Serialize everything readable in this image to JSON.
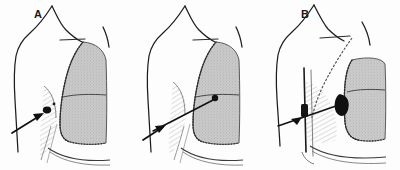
{
  "figure": {
    "background_color": "#fdfdfd",
    "ink_color": "#1a1a1a",
    "lung_fill_color": "#c8c8c8",
    "lesion_color": "#111111",
    "panel_count": 3
  },
  "panels": [
    {
      "id": "a",
      "label": "A",
      "label_x": 34,
      "label_y": 9,
      "caption": "Peripheral pleural-based lesion at chest wall with arrow marker",
      "lung_fill": "#c8c8c8",
      "marker": {
        "type": "arrow",
        "target": "pleural-surface-lesion",
        "direction": "up-right",
        "tail_x": 12,
        "tail_y": 133,
        "tip_x": 44,
        "tip_y": 114
      },
      "lesion": {
        "shape": "small-dark-nodule",
        "cx": 47,
        "cy": 110,
        "r": 3.2
      },
      "features": [
        "neck-outline",
        "shoulder-outline",
        "upper-arm-outline",
        "clavicle-line",
        "lung-silhouette",
        "horizontal-fissure",
        "diaphragm-curve",
        "rib-hatching",
        "pleural-stipple-border"
      ]
    },
    {
      "id": "b",
      "label": "B",
      "label_x": 168,
      "label_y": 9,
      "caption": "Needle track traversing chest wall into intrapulmonary lesion with arrow marker",
      "lung_fill": "#c8c8c8",
      "marker": {
        "type": "needle-with-arrow",
        "target": "intrapulmonary-lesion",
        "direction": "up-right",
        "tail_x": 146,
        "tail_y": 134,
        "tip_x": 215,
        "tip_y": 99
      },
      "lesion": {
        "shape": "small-dark-nodule",
        "cx": 214,
        "cy": 99,
        "r": 3.0
      },
      "features": [
        "neck-outline",
        "shoulder-outline",
        "upper-arm-outline",
        "clavicle-line",
        "lung-silhouette",
        "horizontal-fissure",
        "diaphragm-curve",
        "rib-hatching",
        "needle-track-line",
        "pleural-stipple-border"
      ]
    },
    {
      "id": "c",
      "label": "C",
      "label_x": 309,
      "label_y": 11,
      "caption": "Retracted lung with pleural collection, chest tube and wedge-shaped dark lesion with arrow marker",
      "lung_fill": "#c8c8c8",
      "marker": {
        "type": "arrow",
        "target": "wedge-lesion",
        "direction": "right",
        "tail_x": 288,
        "tail_y": 126,
        "tip_x": 334,
        "tip_y": 112
      },
      "lesion": {
        "shape": "dark-wedge",
        "cx": 345,
        "cy": 103,
        "r": 7.0
      },
      "features": [
        "neck-outline",
        "shoulder-outline",
        "upper-arm-outline",
        "clavicle-line",
        "oblique-rib-line",
        "retracted-lung-silhouette",
        "horizontal-fissure",
        "diaphragm-curve",
        "chest-tube-line",
        "rib-hatching",
        "pleural-stipple-border"
      ]
    }
  ]
}
